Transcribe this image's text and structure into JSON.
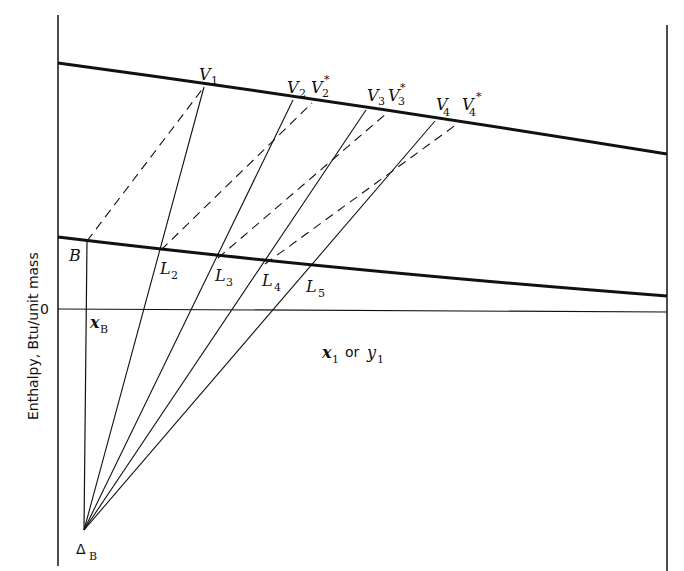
{
  "diagram": {
    "type": "Ponchon-Savarit enthalpy-composition diagram (stripping section)",
    "y_axis_label": "Enthalpy, Btu/unit mass",
    "x_axis_label_x": "x",
    "x_axis_label_x_sub": "1",
    "x_axis_label_or": "or",
    "x_axis_label_y": "y",
    "x_axis_label_y_sub": "1",
    "zero_label": "0",
    "colors": {
      "ink": "#111111",
      "background": "#ffffff"
    },
    "curves": {
      "vapor": {
        "name": "saturated vapor curve",
        "points": [
          [
            58,
            63
          ],
          [
            204,
            87
          ],
          [
            293,
            100
          ],
          [
            366,
            110
          ],
          [
            435,
            121
          ],
          [
            550,
            136
          ],
          [
            667,
            154
          ]
        ]
      },
      "liquid": {
        "name": "saturated liquid curve",
        "points": [
          [
            58,
            237
          ],
          [
            87,
            241
          ],
          [
            161,
            250
          ],
          [
            218,
            258
          ],
          [
            265,
            264
          ],
          [
            310,
            270
          ],
          [
            450,
            283
          ],
          [
            667,
            296
          ]
        ]
      }
    },
    "points": {
      "B": {
        "label": "B",
        "sub": "",
        "x": 87,
        "y": 241
      },
      "xB": {
        "label": "x",
        "sub": "B",
        "x": 87,
        "y": 309
      },
      "deltaB": {
        "label": "Δ",
        "sub": "B",
        "x": 84,
        "y": 530
      },
      "V1": {
        "label": "V",
        "sub": "1",
        "star": "",
        "x": 204,
        "y": 87
      },
      "V2": {
        "label": "V",
        "sub": "2",
        "star": "",
        "x": 293,
        "y": 100
      },
      "V2s": {
        "label": "V",
        "sub": "2",
        "star": "*",
        "x": 312,
        "y": 103
      },
      "V3": {
        "label": "V",
        "sub": "3",
        "star": "",
        "x": 366,
        "y": 110
      },
      "V3s": {
        "label": "V",
        "sub": "3",
        "star": "*",
        "x": 387,
        "y": 113
      },
      "V4": {
        "label": "V",
        "sub": "4",
        "star": "",
        "x": 435,
        "y": 121
      },
      "V4s": {
        "label": "V",
        "sub": "4",
        "star": "*",
        "x": 457,
        "y": 124
      },
      "L2": {
        "label": "L",
        "sub": "2",
        "x": 161,
        "y": 250
      },
      "L3": {
        "label": "L",
        "sub": "3",
        "x": 218,
        "y": 258
      },
      "L4": {
        "label": "L",
        "sub": "4",
        "x": 265,
        "y": 264
      },
      "L5": {
        "label": "L",
        "sub": "5",
        "x": 310,
        "y": 270
      }
    },
    "operating_lines": [
      {
        "from": "deltaB",
        "to": "V1",
        "style": "solid"
      },
      {
        "from": "deltaB",
        "to": "V2",
        "style": "solid"
      },
      {
        "from": "deltaB",
        "to": "V3",
        "style": "solid"
      },
      {
        "from": "deltaB",
        "to": "V4",
        "style": "solid"
      }
    ],
    "tie_lines": [
      {
        "from": "B",
        "to": "V1",
        "style": "dashed"
      },
      {
        "from": "L2",
        "to": "V2s",
        "style": "dashed"
      },
      {
        "from": "L3",
        "to": "V3s",
        "style": "dashed"
      },
      {
        "from": "L4",
        "to": "V4s",
        "style": "dashed"
      }
    ]
  }
}
